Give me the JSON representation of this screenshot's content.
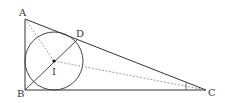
{
  "diagram": {
    "type": "geometry",
    "points": {
      "A": {
        "label": "A",
        "x": 25,
        "y": 19
      },
      "B": {
        "label": "B",
        "x": 25,
        "y": 90
      },
      "C": {
        "label": "C",
        "x": 206,
        "y": 90
      },
      "D": {
        "label": "D",
        "x": 77,
        "y": 40
      },
      "I": {
        "label": "I",
        "x": 54,
        "y": 61
      }
    },
    "incircle": {
      "cx": 54,
      "cy": 61,
      "r": 29
    },
    "solid_segments": [
      "AB",
      "BC",
      "AC",
      "BD"
    ],
    "dashed_segments": [
      "AI",
      "IC"
    ],
    "angle_marks": [
      "C"
    ],
    "colors": {
      "stroke": "#333333",
      "dashed": "#888888"
    }
  }
}
